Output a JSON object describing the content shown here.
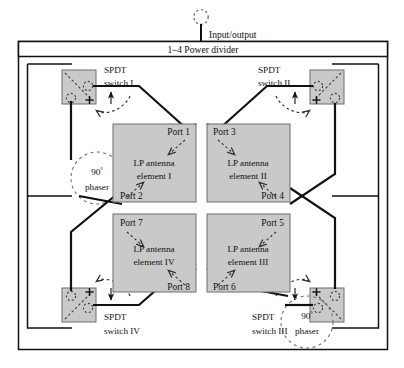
{
  "figure": {
    "type": "block-diagram",
    "title_text": "Input/output",
    "power_divider_label": "1–4 Power divider",
    "colors": {
      "line": "#111111",
      "block_fill": "#c9c9c9",
      "block_stroke": "#5a5a5a",
      "dashed": "#3a3a3a",
      "background": "#ffffff"
    }
  },
  "feed": {
    "io_label": "Input/output",
    "divider_label": "1–4 Power divider"
  },
  "switches": [
    {
      "id": "I",
      "line1": "SPDT",
      "line2": "switch I"
    },
    {
      "id": "II",
      "line1": "SPDT",
      "line2": "switch II"
    },
    {
      "id": "III",
      "line1": "SPDT",
      "line2": "switch III"
    },
    {
      "id": "IV",
      "line1": "SPDT",
      "line2": "switch IV"
    }
  ],
  "antennas": [
    {
      "id": "I",
      "line1": "LP antenna",
      "line2": "element I",
      "ports": [
        "Port 1",
        "Port 2"
      ]
    },
    {
      "id": "II",
      "line1": "LP antenna",
      "line2": "element II",
      "ports": [
        "Port 3",
        "Port 4"
      ]
    },
    {
      "id": "III",
      "line1": "LP antenna",
      "line2": "element III",
      "ports": [
        "Port 5",
        "Port 6"
      ]
    },
    {
      "id": "IV",
      "line1": "LP antenna",
      "line2": "element IV",
      "ports": [
        "Port 7",
        "Port 8"
      ]
    }
  ],
  "phasers": [
    {
      "id": "upper-left",
      "line1": "90°",
      "line2": "phaser",
      "degree_value": "90",
      "degree_unit": "°"
    },
    {
      "id": "lower-right",
      "line1": "90°",
      "line2": "phaser",
      "degree_value": "90",
      "degree_unit": "°"
    }
  ],
  "phaser_label": {
    "deg": "90",
    "unit": "°",
    "word": "phaser"
  },
  "ports": {
    "p1": "Port 1",
    "p2": "Port 2",
    "p3": "Port 3",
    "p4": "Port 4",
    "p5": "Port 5",
    "p6": "Port 6",
    "p7": "Port 7",
    "p8": "Port 8"
  },
  "switch_labels": {
    "s1_l1": "SPDT",
    "s1_l2": "switch I",
    "s2_l1": "SPDT",
    "s2_l2": "switch II",
    "s3_l1": "SPDT",
    "s3_l2": "switch III",
    "s4_l1": "SPDT",
    "s4_l2": "switch IV"
  },
  "antenna_labels": {
    "a1_l1": "LP antenna",
    "a1_l2": "element I",
    "a2_l1": "LP antenna",
    "a2_l2": "element II",
    "a3_l1": "LP antenna",
    "a3_l2": "element III",
    "a4_l1": "LP antenna",
    "a4_l2": "element IV"
  }
}
